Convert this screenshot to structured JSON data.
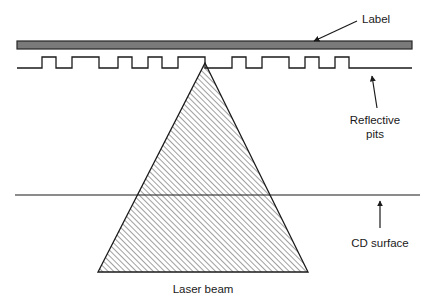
{
  "figure": {
    "background_color": "#ffffff",
    "stroke_color": "#1a1a1a",
    "label_fill_color": "#7a7a7a",
    "hatch_color": "#2b2b2b"
  },
  "labels": {
    "label_disc": "Label",
    "reflective_pits_line1": "Reflective",
    "reflective_pits_line2": "pits",
    "cd_surface": "CD surface",
    "laser_beam": "Laser beam"
  },
  "geometry": {
    "label_bar": {
      "x": 17,
      "y": 41,
      "width": 395,
      "height": 8
    },
    "pit_baseline_y": 68,
    "pit_top_y": 57,
    "pit_line_start_x": 17,
    "pit_line_end_x": 412,
    "cd_surface_line": {
      "x1": 15,
      "y1": 195,
      "x2": 420,
      "y2": 195
    },
    "beam_apex": {
      "x": 205,
      "y": 63
    },
    "beam_base_left": {
      "x": 98,
      "y": 272
    },
    "beam_base_right": {
      "x": 308,
      "y": 272
    },
    "hatch_angle_deg": 45,
    "hatch_spacing_px": 4
  },
  "pits": [
    {
      "start_x": 42,
      "end_x": 56
    },
    {
      "start_x": 72,
      "end_x": 99
    },
    {
      "start_x": 118,
      "end_x": 132
    },
    {
      "start_x": 148,
      "end_x": 162
    },
    {
      "start_x": 178,
      "end_x": 205
    },
    {
      "start_x": 232,
      "end_x": 246
    },
    {
      "start_x": 262,
      "end_x": 289
    },
    {
      "start_x": 305,
      "end_x": 319
    },
    {
      "start_x": 335,
      "end_x": 349
    }
  ],
  "annotations": [
    {
      "name": "label-callout",
      "text_key": "label_disc",
      "text_x": 362,
      "text_y": 19,
      "arrow_from": {
        "x": 357,
        "y": 21
      },
      "arrow_to": {
        "x": 314,
        "y": 41
      },
      "anchor": "start"
    },
    {
      "name": "reflective-pits-callout",
      "text_x": 375,
      "text_y": 122,
      "arrow_from": {
        "x": 377,
        "y": 108
      },
      "arrow_to": {
        "x": 372,
        "y": 76
      },
      "anchor": "middle"
    },
    {
      "name": "cd-surface-callout",
      "text_key": "cd_surface",
      "text_x": 380,
      "text_y": 244,
      "arrow_from": {
        "x": 380,
        "y": 228
      },
      "arrow_to": {
        "x": 380,
        "y": 201
      },
      "anchor": "middle"
    },
    {
      "name": "laser-beam-caption",
      "text_key": "laser_beam",
      "text_x": 203,
      "text_y": 291,
      "anchor": "middle"
    }
  ]
}
